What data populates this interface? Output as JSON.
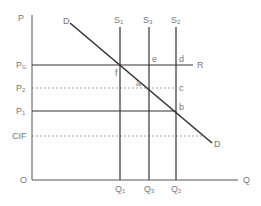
{
  "diagram": {
    "type": "economics-supply-demand-quota-tariff",
    "axes": {
      "y_label": "P",
      "x_label": "Q",
      "origin_label": "O"
    },
    "price_levels": [
      {
        "key": "PG",
        "label": "P",
        "sub": "G",
        "style": "solid",
        "end_label": "R"
      },
      {
        "key": "P2",
        "label": "P",
        "sub": "2",
        "style": "dashed"
      },
      {
        "key": "P1",
        "label": "P",
        "sub": "1",
        "style": "solid"
      },
      {
        "key": "CIF",
        "label": "CIF",
        "sub": "",
        "style": "dashed"
      }
    ],
    "supply_curves": [
      {
        "label": "S",
        "sub": "1",
        "quantity": "Q1"
      },
      {
        "label": "S",
        "sub": "3",
        "quantity": "Q3"
      },
      {
        "label": "S",
        "sub": "2",
        "quantity": "Q2"
      }
    ],
    "quantities": [
      {
        "label": "Q",
        "sub": "1"
      },
      {
        "label": "Q",
        "sub": "3"
      },
      {
        "label": "Q",
        "sub": "2"
      }
    ],
    "demand": {
      "start_label": "D",
      "end_label": "D"
    },
    "points": {
      "f": "f",
      "e": "e",
      "d": "d",
      "a": "a",
      "c": "c",
      "b": "b"
    },
    "colors": {
      "line": "#333333",
      "axis": "#555555",
      "label": "#777777",
      "dashed": "#888888"
    }
  }
}
